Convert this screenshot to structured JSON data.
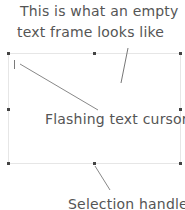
{
  "annotations": {
    "top_line1": "This is what an empty",
    "top_line2": "text frame looks like",
    "cursor_label": "Flashing text cursor",
    "handle_label": "Selection handle"
  },
  "colors": {
    "text": "#555555",
    "frame_border": "#e6e6e6",
    "handle": "#444444",
    "leader_line": "#777777"
  }
}
